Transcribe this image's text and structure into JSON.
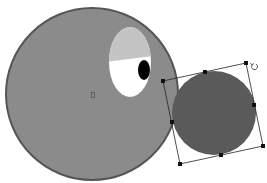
{
  "canvas": {
    "width": 267,
    "height": 183,
    "background": "#ffffff"
  },
  "shapes": {
    "big_circle": {
      "cx": 92,
      "cy": 94,
      "r": 86,
      "fill": "#8b8b8b",
      "stroke": "#555555",
      "stroke_width": 2
    },
    "eye_white": {
      "cx": 130,
      "cy": 62,
      "rx": 21,
      "ry": 35,
      "fill": "#ffffff"
    },
    "eye_lid": {
      "fill": "#c4c4c4"
    },
    "pupil": {
      "cx": 144,
      "cy": 70,
      "rx": 6,
      "ry": 10,
      "fill": "#000000"
    },
    "center_marker": {
      "x": 93,
      "y": 95
    },
    "small_circle": {
      "cx": 214,
      "cy": 113,
      "r": 42,
      "fill": "#5a5a5a"
    }
  },
  "selection": {
    "corners": [
      [
        163,
        81
      ],
      [
        246,
        63
      ],
      [
        263,
        146
      ],
      [
        180,
        164
      ]
    ],
    "mid_handles": [
      [
        205,
        72
      ],
      [
        254,
        105
      ],
      [
        221,
        155
      ],
      [
        172,
        122
      ]
    ],
    "rotate_icon": {
      "x": 254,
      "y": 66
    },
    "stroke": "#222222",
    "handle_color": "#111111"
  }
}
